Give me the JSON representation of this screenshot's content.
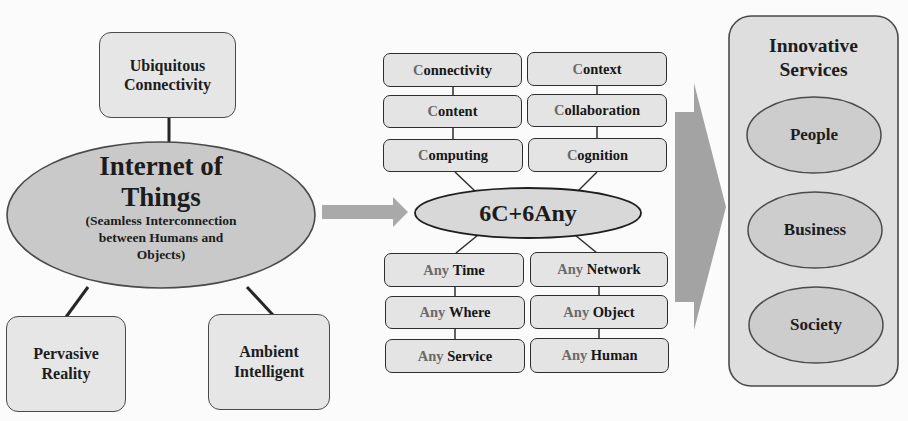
{
  "diagram": {
    "colors": {
      "background": "#fbfbfb",
      "node_fill": "#e4e4e4",
      "ellipse_fill": "#cfcfcf",
      "arrow_fill": "#a9a9a9",
      "stroke": "#2e2e2e",
      "muted_text": "#6a6a6a"
    },
    "left_cluster": {
      "center": {
        "title": "Internet of Things",
        "title_line1": "Internet of",
        "title_line2": "Things",
        "subtitle_line1": "(Seamless Interconnection",
        "subtitle_line2": "between Humans and",
        "subtitle_line3": "Objects)"
      },
      "top": {
        "line1": "Ubiquitous",
        "line2": "Connectivity"
      },
      "bottom_left": {
        "line1": "Pervasive",
        "line2": "Reality"
      },
      "bottom_right": {
        "line1": "Ambient",
        "line2": "Intelligent"
      }
    },
    "middle_cluster": {
      "center": "6C+6Any",
      "six_c": [
        {
          "initial": "C",
          "rest": "onnectivity"
        },
        {
          "initial": "C",
          "rest": "ontext"
        },
        {
          "initial": "C",
          "rest": "ontent"
        },
        {
          "initial": "C",
          "rest": "ollaboration"
        },
        {
          "initial": "C",
          "rest": "omputing"
        },
        {
          "initial": "C",
          "rest": "ognition"
        }
      ],
      "six_any": [
        {
          "prefix": "Any",
          "word": "Time"
        },
        {
          "prefix": "Any",
          "word": "Network"
        },
        {
          "prefix": "Any",
          "word": "Where"
        },
        {
          "prefix": "Any",
          "word": "Object"
        },
        {
          "prefix": "Any",
          "word": "Service"
        },
        {
          "prefix": "Any",
          "word": "Human"
        }
      ]
    },
    "right_cluster": {
      "title_line1": "Innovative",
      "title_line2": "Services",
      "items": [
        "People",
        "Business",
        "Society"
      ]
    }
  }
}
